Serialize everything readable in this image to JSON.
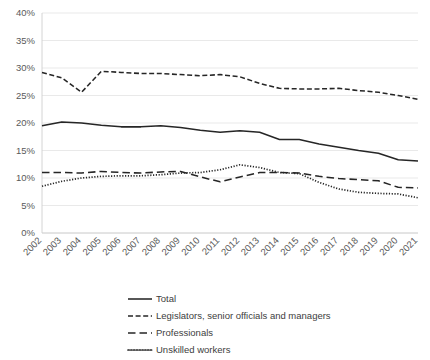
{
  "chart_data": {
    "type": "line",
    "title": "",
    "xlabel": "",
    "ylabel": "",
    "ylim": [
      0,
      40
    ],
    "ytick_values": [
      0,
      5,
      10,
      15,
      20,
      25,
      30,
      35,
      40
    ],
    "ytick_labels": [
      "0%",
      "5%",
      "10%",
      "15%",
      "20%",
      "25%",
      "30%",
      "35%",
      "40%"
    ],
    "grid": true,
    "legend_position": "bottom",
    "categories": [
      "2002",
      "2003",
      "2004",
      "2005",
      "2006",
      "2007",
      "2008",
      "2009",
      "2010",
      "2011",
      "2012",
      "2013",
      "2014",
      "2015",
      "2016",
      "2017",
      "2018",
      "2019",
      "2020",
      "2021"
    ],
    "series": [
      {
        "name": "Total",
        "style": "solid",
        "color": "#262626",
        "values": [
          19.5,
          20.2,
          20.0,
          19.6,
          19.3,
          19.3,
          19.5,
          19.2,
          18.7,
          18.3,
          18.6,
          18.3,
          17.0,
          17.0,
          16.2,
          15.6,
          15.0,
          14.5,
          13.3,
          13.1
        ]
      },
      {
        "name": "Legislators, senior officials and managers",
        "style": "dashed",
        "color": "#262626",
        "values": [
          29.2,
          28.2,
          25.6,
          29.4,
          29.2,
          29.0,
          29.0,
          28.8,
          28.6,
          28.8,
          28.4,
          27.2,
          26.3,
          26.2,
          26.2,
          26.3,
          25.9,
          25.6,
          25.0,
          24.3
        ]
      },
      {
        "name": "Professionals",
        "style": "longdash",
        "color": "#262626",
        "values": [
          11.0,
          11.0,
          10.9,
          11.2,
          11.0,
          10.9,
          11.1,
          11.2,
          10.2,
          9.3,
          10.2,
          11.0,
          11.0,
          10.9,
          10.3,
          9.9,
          9.7,
          9.5,
          8.3,
          8.2
        ]
      },
      {
        "name": "Unskilled workers",
        "style": "dotted",
        "color": "#262626",
        "values": [
          8.5,
          9.4,
          10.0,
          10.3,
          10.4,
          10.4,
          10.6,
          10.9,
          11.0,
          11.5,
          12.4,
          11.9,
          11.0,
          10.8,
          9.2,
          8.0,
          7.4,
          7.2,
          7.1,
          6.4
        ]
      }
    ]
  },
  "legend": {
    "items": [
      {
        "label": "Total"
      },
      {
        "label": "Legislators, senior officials and managers"
      },
      {
        "label": "Professionals"
      },
      {
        "label": "Unskilled workers"
      }
    ]
  }
}
